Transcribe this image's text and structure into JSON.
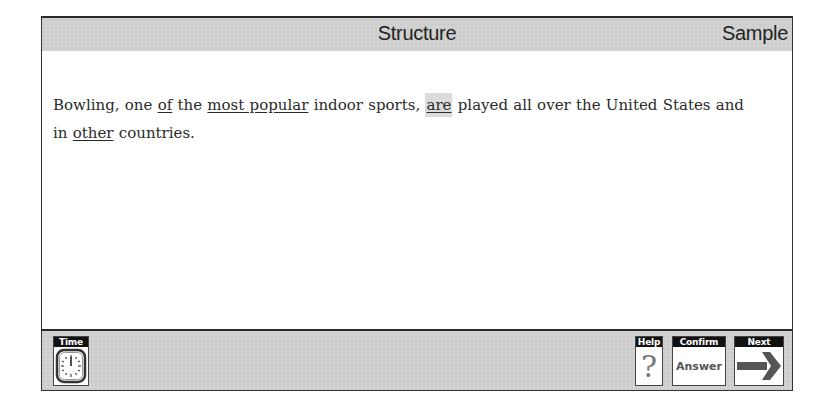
{
  "header": {
    "title": "Structure",
    "section_label": "Sample"
  },
  "question": {
    "segments": [
      {
        "text": "Bowling, one ",
        "underlined": false
      },
      {
        "text": "of",
        "underlined": true,
        "option": "A"
      },
      {
        "text": " the ",
        "underlined": false
      },
      {
        "text": "most popular",
        "underlined": true,
        "option": "B"
      },
      {
        "text": " indoor sports, ",
        "underlined": false
      },
      {
        "text": "are",
        "underlined": true,
        "option": "C",
        "selected": true
      },
      {
        "text": " played all over the United States and in ",
        "underlined": false
      },
      {
        "text": "other",
        "underlined": true,
        "option": "D"
      },
      {
        "text": " countries.",
        "underlined": false
      }
    ],
    "selected_option": "are"
  },
  "toolbar": {
    "time": {
      "label": "Time",
      "icon": "clock-icon"
    },
    "help": {
      "label": "Help",
      "glyph": "?",
      "icon": "question-mark-icon"
    },
    "confirm": {
      "label": "Confirm",
      "text": "Answer"
    },
    "next": {
      "label": "Next",
      "icon": "right-arrow-icon"
    }
  },
  "colors": {
    "bar_bg": "#d2d2d2",
    "label_bg": "#111111",
    "highlight": "#dcdcdc",
    "arrow": "#555555"
  }
}
